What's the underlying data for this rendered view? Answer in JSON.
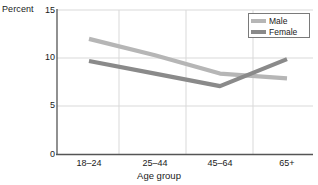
{
  "chart_data": {
    "type": "line",
    "title": "",
    "subtitle": "",
    "xlabel": "Age group",
    "ylabel": "Percent",
    "categories": [
      "18–24",
      "25–44",
      "45–64",
      "65+"
    ],
    "series": [
      {
        "name": "Male",
        "values": [
          12.0,
          10.3,
          8.4,
          7.9
        ],
        "color": "#b6b6b6"
      },
      {
        "name": "Female",
        "values": [
          9.7,
          8.4,
          7.1,
          9.9
        ],
        "color": "#8a8a8a"
      }
    ],
    "ylim": [
      0,
      15
    ],
    "yticks": [
      0,
      5,
      10,
      15
    ],
    "ytick_labels": [
      "0",
      "5",
      "10",
      "15"
    ],
    "grid": "both",
    "legend_position": "top-right",
    "legend_entries": [
      "Male",
      "Female"
    ]
  },
  "axis": {
    "y_title": "Percent",
    "x_title": "Age group",
    "y_tick_0": "0",
    "y_tick_1": "5",
    "y_tick_2": "10",
    "y_tick_3": "15",
    "x_tick_0": "18–24",
    "x_tick_1": "25–44",
    "x_tick_2": "45–64",
    "x_tick_3": "65+"
  },
  "legend": {
    "male_label": "Male",
    "female_label": "Female",
    "male_color": "#b6b6b6",
    "female_color": "#8a8a8a"
  }
}
